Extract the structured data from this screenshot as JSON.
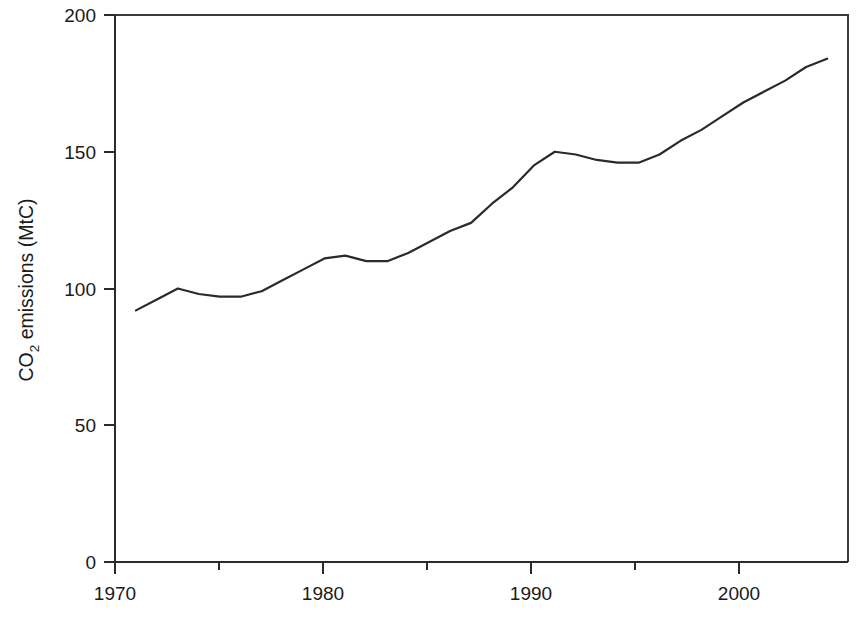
{
  "figure": {
    "name": "co2-emissions-line-chart",
    "background_color": "#ffffff",
    "line_color": "#2a2a2a",
    "axis_color": "#2b2b2b"
  },
  "axes": {
    "y_axis_title_main": "emissions (MtC)",
    "y_axis_title_prefix": "CO",
    "y_axis_title_subscript": "2",
    "y_tick_labels": [
      "0",
      "50",
      "100",
      "150",
      "200"
    ],
    "y_tick_values": [
      0,
      50,
      100,
      150,
      200
    ],
    "x_tick_labels": [
      "1970",
      "1980",
      "1990",
      "2000"
    ],
    "x_tick_values": [
      1970,
      1980,
      1990,
      2000
    ],
    "x_minor_tick_values": [
      1975,
      1985,
      1995
    ],
    "x_axis_title": ""
  },
  "chart_data": {
    "type": "line",
    "title": "",
    "xlabel": "",
    "ylabel": "CO2 emissions (MtC)",
    "xlim": [
      1970,
      2005
    ],
    "ylim": [
      0,
      200
    ],
    "grid": false,
    "legend": false,
    "series": [
      {
        "name": "CO2 emissions (MtC)",
        "x": [
          1971,
          1972,
          1973,
          1974,
          1975,
          1976,
          1977,
          1978,
          1979,
          1980,
          1981,
          1982,
          1983,
          1984,
          1985,
          1986,
          1987,
          1988,
          1989,
          1990,
          1991,
          1992,
          1993,
          1994,
          1995,
          1996,
          1997,
          1998,
          1999,
          2000,
          2001,
          2002,
          2003,
          2004
        ],
        "values": [
          92,
          96,
          100,
          98,
          97,
          97,
          99,
          103,
          107,
          111,
          112,
          110,
          110,
          113,
          117,
          121,
          124,
          131,
          137,
          145,
          150,
          149,
          147,
          146,
          146,
          149,
          154,
          158,
          163,
          168,
          172,
          176,
          181,
          184
        ]
      }
    ]
  }
}
